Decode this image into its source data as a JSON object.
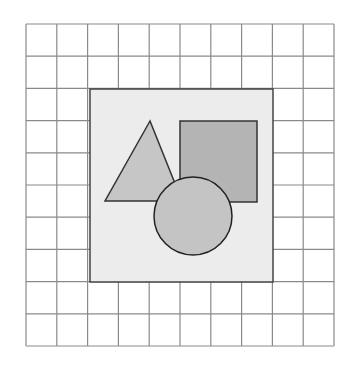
{
  "diagram": {
    "background": "#ffffff",
    "grid": {
      "x": 26,
      "y": 24,
      "width": 308,
      "height": 322,
      "columns": 10,
      "rows": 10,
      "stroke": "#8a8a8a",
      "stroke_width": 1.2
    },
    "panel": {
      "x": 90,
      "y": 89,
      "width": 183,
      "height": 193,
      "fill": "#ececec",
      "stroke": "#444444",
      "stroke_width": 1.5
    },
    "shapes": {
      "triangle": {
        "points": "150,121 105,201 182,201",
        "fill": "#c6c6c6",
        "stroke": "#333333",
        "stroke_width": 1.5
      },
      "square": {
        "x": 180,
        "y": 121,
        "width": 77,
        "height": 81,
        "fill": "#b4b4b4",
        "stroke": "#333333",
        "stroke_width": 1.5
      },
      "circle": {
        "cx": 193,
        "cy": 216,
        "r": 39,
        "fill": "#c4c4c4",
        "stroke": "#222222",
        "stroke_width": 1.5
      }
    }
  }
}
